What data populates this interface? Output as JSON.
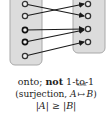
{
  "diagram": {
    "domain_set": {
      "label": "A",
      "element_count": 5,
      "fill": "#dcdcdc",
      "stroke": "#a8a8a8"
    },
    "codomain_set": {
      "label": "B",
      "element_count": 4,
      "fill": "#dcdcdc",
      "stroke": "#a8a8a8"
    },
    "mappings": [
      {
        "from": 1,
        "to": 2
      },
      {
        "from": 2,
        "to": 1
      },
      {
        "from": 3,
        "to": 3
      },
      {
        "from": 4,
        "to": 3
      },
      {
        "from": 5,
        "to": 4
      }
    ],
    "arrow_color": "#1a1a1a"
  },
  "caption": {
    "line1_prefix": "onto; ",
    "line1_bold": "not",
    "line1_suffix": " 1-to-1",
    "line2_prefix": "(surjection, ",
    "line2_a": "A",
    "line2_arrow": "↦",
    "line2_arrow_label": "SUR",
    "line2_b": "B",
    "line2_suffix": ")",
    "line3": "|A| ≥ |B|"
  }
}
